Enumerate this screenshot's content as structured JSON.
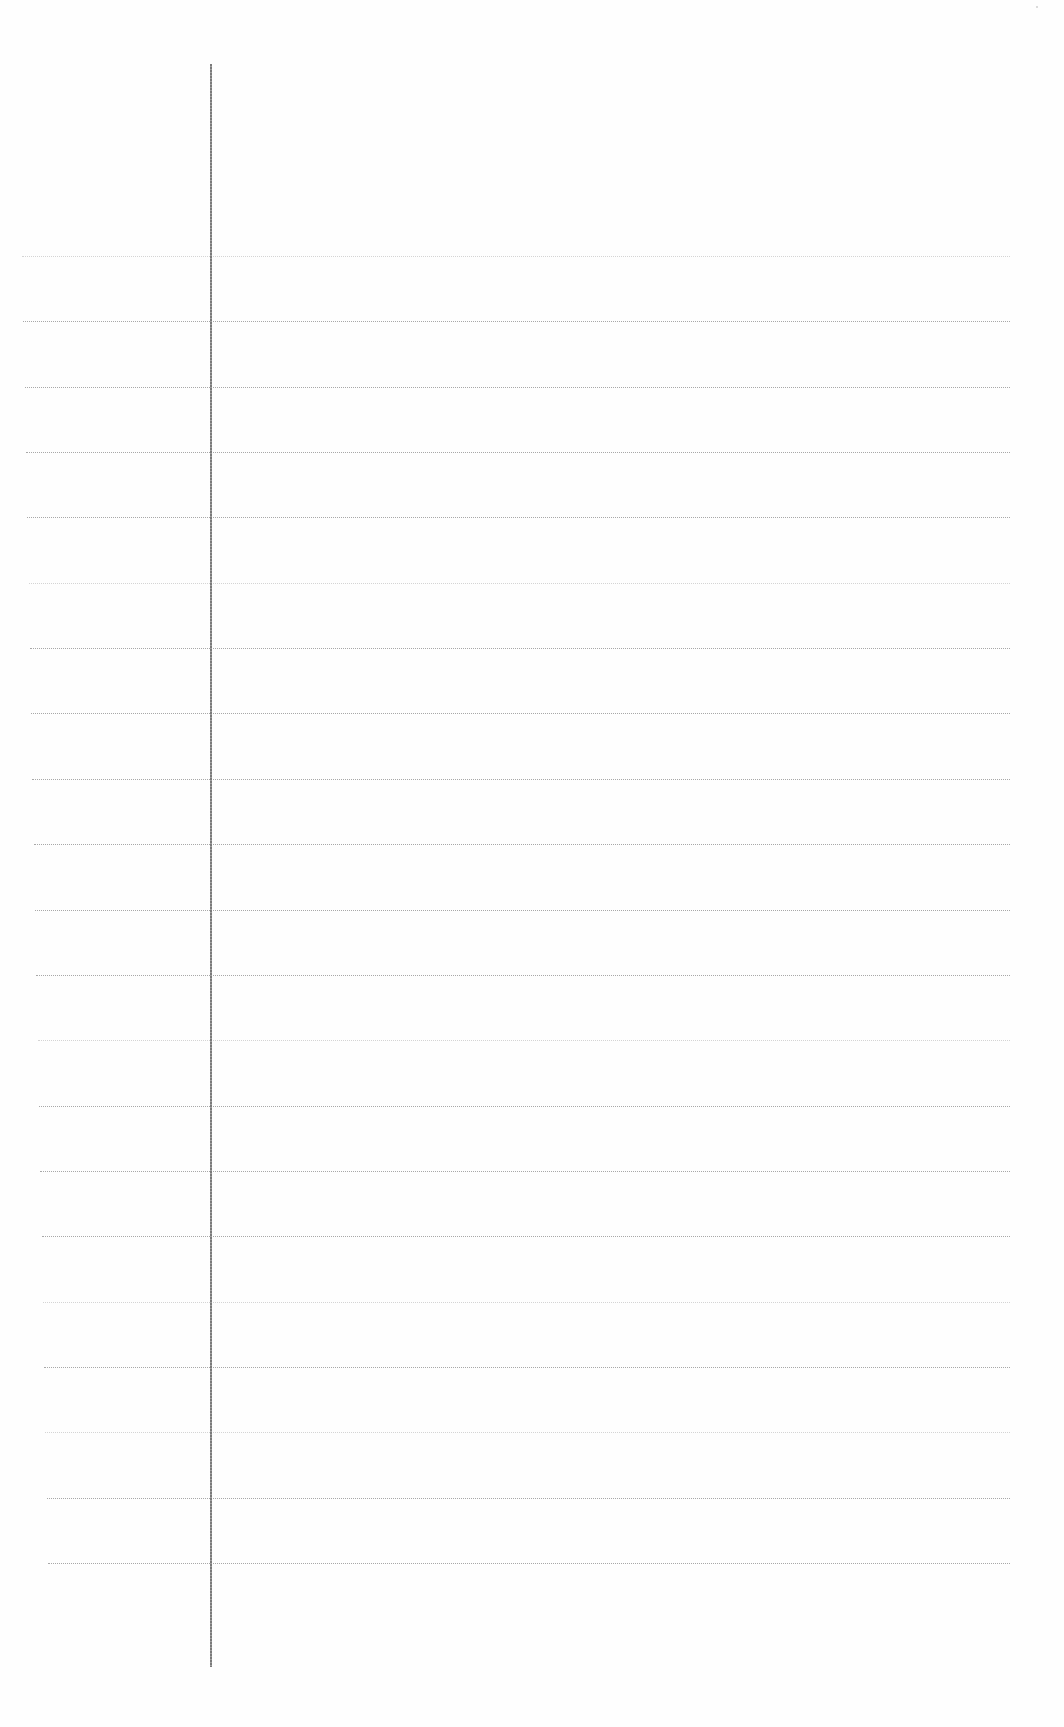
{
  "document": {
    "type": "lined-notebook-page",
    "content": "",
    "background_color": "#fefefe",
    "rule_color": "#a8a8a8",
    "margin_line_color": "#7a7a7a",
    "rule_count": 21,
    "rule_start_y": 256,
    "rule_spacing_px": 65.35,
    "rule_left_x": 22,
    "rule_right_x": 1010,
    "margin_line_x": 210,
    "margin_line_top_y": 64,
    "margin_line_bottom_y": 1667
  }
}
